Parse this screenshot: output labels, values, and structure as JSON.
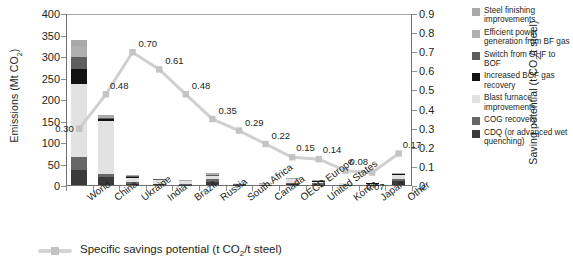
{
  "chart_data": {
    "type": "bar",
    "title": "",
    "categories": [
      "World",
      "China",
      "Ukraine",
      "India",
      "Brazil",
      "Russia",
      "South Africa",
      "Canada",
      "OECD Europe",
      "United States",
      "Korea",
      "Japan",
      "Other"
    ],
    "ylabel_left": "Emissions (Mt CO2)",
    "ylabel_right": "Saving potential (t CO2/t steel)",
    "ylim_left": [
      0,
      400
    ],
    "yticks_left": [
      "0",
      "50",
      "100",
      "150",
      "200",
      "250",
      "300",
      "350",
      "400"
    ],
    "ylim_right": [
      0,
      0.9
    ],
    "yticks_right": [
      "0",
      "0.1",
      "0.2",
      "0.3",
      "0.4",
      "0.5",
      "0.6",
      "0.7",
      "0.8",
      "0.9"
    ],
    "grid": false,
    "legend_position": "right",
    "stack_series": [
      {
        "name": "CDQ (or advanced wet quenching)",
        "color": "#3a3a3a",
        "values": [
          36,
          18,
          3.5,
          2.0,
          1.0,
          8.0,
          1.0,
          0.5,
          2.0,
          1.0,
          0.5,
          0.5,
          9.0
        ]
      },
      {
        "name": "COG recovery",
        "color": "#676767",
        "values": [
          30,
          7,
          4.0,
          1.5,
          1.0,
          5.0,
          0.6,
          0.4,
          3.0,
          3.0,
          0.5,
          0.5,
          4.0
        ]
      },
      {
        "name": "Blast furnace improvements",
        "color": "#e2e2e2",
        "values": [
          170,
          125,
          8.0,
          8.0,
          7.0,
          7.0,
          3.0,
          2.0,
          8.0,
          4.0,
          3.0,
          2.5,
          10.0
        ]
      },
      {
        "name": "Increased BOF gas recovery",
        "color": "#121212",
        "values": [
          34,
          3,
          2.0,
          1.0,
          0.6,
          1.5,
          0.4,
          0.3,
          1.0,
          0.8,
          0.4,
          0.3,
          1.5
        ]
      },
      {
        "name": "Switch from OHF to BOF",
        "color": "#5e5e5e",
        "values": [
          28,
          2,
          3.0,
          0.5,
          0.3,
          3.0,
          0.2,
          0.2,
          0.6,
          0.4,
          0.2,
          0.2,
          1.0
        ]
      },
      {
        "name": "Efficient power generation from BF gas",
        "color": "#b0b0b0",
        "values": [
          25,
          4,
          1.5,
          1.0,
          0.6,
          1.5,
          0.4,
          0.3,
          1.0,
          0.8,
          0.4,
          0.3,
          1.5
        ]
      },
      {
        "name": "Steel finishing improvements",
        "color": "#a9a9a9",
        "values": [
          15,
          3,
          1.0,
          0.8,
          0.5,
          1.0,
          0.3,
          0.2,
          0.8,
          0.6,
          0.3,
          0.2,
          1.0
        ]
      }
    ],
    "line_series": {
      "name": "Specific savings potential (t CO2/t steel)",
      "color": "#d0d0d0",
      "values": [
        0.3,
        0.48,
        0.7,
        0.61,
        0.48,
        0.35,
        0.29,
        0.22,
        0.15,
        0.14,
        0.08,
        0.07,
        0.17
      ],
      "labels": [
        "0.30",
        "0.48",
        "0.70",
        "0.61",
        "0.48",
        "0.35",
        "0.29",
        "0.22",
        "0.15",
        "0.14",
        "0.08",
        "0.07",
        "0.17"
      ]
    }
  },
  "axes": {
    "left_title_pre": "Emissions (Mt CO",
    "left_title_sub": "2",
    "left_title_post": ")",
    "right_title_pre": "Saving potential (t CO",
    "right_title_sub": "2",
    "right_title_post": "/t steel)"
  },
  "legend": {
    "items": [
      {
        "label": "Steel finishing improvements",
        "color": "#a9a9a9"
      },
      {
        "label": "Efficient power generation from BF gas",
        "color": "#b0b0b0"
      },
      {
        "label": "Switch from OHF to BOF",
        "color": "#5e5e5e"
      },
      {
        "label": "Increased BOF gas recovery",
        "color": "#121212"
      },
      {
        "label": "Blast furnace improvements",
        "color": "#e2e2e2"
      },
      {
        "label": "COG recovery",
        "color": "#676767"
      },
      {
        "label": "CDQ (or advanced wet quenching)",
        "color": "#3a3a3a"
      }
    ]
  },
  "bottom_legend": {
    "text_pre": "Specific savings potential (t CO",
    "text_sub": "2",
    "text_post": "/t steel)"
  }
}
